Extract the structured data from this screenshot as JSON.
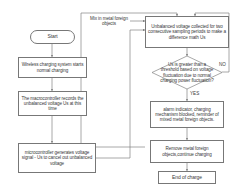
{
  "diagram": {
    "type": "flowchart",
    "line_color": "#777777",
    "text_color": "#3a3a3a",
    "background": "#ffffff"
  },
  "nodes": {
    "start": "Start",
    "normal_charging": "Wireless charging system starts normal charging",
    "record_voltage": "The macrocontroller records the unbalanced voltage Us at this time",
    "generate_signal": "microcontroller generates voltage signal - Us to cancel out unbalanced voltage",
    "mix_objects": "Mix in metal foreign objects",
    "collect_voltage": "Unbalanced voltage collected for two consecutive sampling periods to make a difference math Us",
    "decision": "Us is greater than a threshold based on voltage fluctuation due to normal charging power fluctuation?",
    "alarm": "alarm indicator, charging mechanism blocked, reminder of mixed metal foreign objects.",
    "remove_objects": "Remove metal foreign objects,continue charging",
    "end": "End of charge"
  },
  "edge_labels": {
    "no": "NO",
    "yes": "YES"
  }
}
